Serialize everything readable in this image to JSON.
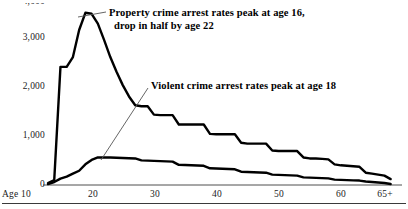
{
  "chart_data": {
    "type": "line",
    "title": "",
    "xlabel": "Age",
    "ylabel": "",
    "ylim": [
      0,
      4000
    ],
    "xlim": [
      10,
      66
    ],
    "grid": false,
    "legend_position": "none",
    "y_ticks": [
      "4,000",
      "3,000",
      "2,000",
      "1,000",
      "0"
    ],
    "y_tick_values": [
      4000,
      3000,
      2000,
      1000,
      0
    ],
    "x_ticks": [
      "Age 10",
      "20",
      "30",
      "40",
      "50",
      "60",
      "65+"
    ],
    "x_tick_values": [
      10,
      20,
      30,
      40,
      50,
      60,
      65
    ],
    "series": [
      {
        "name": "Property crime arrest rates",
        "x": [
          10,
          11,
          12,
          13,
          14,
          15,
          16,
          17,
          18,
          19,
          20,
          21,
          22,
          23,
          24,
          25,
          26,
          27,
          28,
          29,
          30,
          31,
          32,
          33,
          34,
          35,
          36,
          37,
          38,
          39,
          40,
          41,
          42,
          43,
          44,
          45,
          46,
          47,
          48,
          49,
          50,
          51,
          52,
          53,
          54,
          55,
          56,
          57,
          58,
          59,
          60,
          61,
          62,
          63,
          64,
          65
        ],
        "values": [
          40,
          100,
          2400,
          2400,
          2600,
          3150,
          3500,
          3480,
          3280,
          2950,
          2600,
          2300,
          2030,
          1800,
          1620,
          1600,
          1600,
          1430,
          1420,
          1420,
          1420,
          1230,
          1230,
          1230,
          1230,
          1230,
          1040,
          1030,
          1030,
          1030,
          1030,
          860,
          840,
          840,
          840,
          840,
          700,
          690,
          690,
          690,
          690,
          560,
          540,
          540,
          530,
          520,
          420,
          400,
          390,
          380,
          370,
          250,
          230,
          210,
          190,
          120
        ]
      },
      {
        "name": "Violent crime arrest rates",
        "x": [
          10,
          11,
          12,
          13,
          14,
          15,
          16,
          17,
          18,
          19,
          20,
          21,
          22,
          23,
          24,
          25,
          26,
          27,
          28,
          29,
          30,
          31,
          32,
          33,
          34,
          35,
          36,
          37,
          38,
          39,
          40,
          41,
          42,
          43,
          44,
          45,
          46,
          47,
          48,
          49,
          50,
          51,
          52,
          53,
          54,
          55,
          56,
          57,
          58,
          59,
          60,
          61,
          62,
          63,
          64,
          65
        ],
        "values": [
          20,
          60,
          130,
          170,
          230,
          290,
          420,
          510,
          560,
          560,
          560,
          555,
          550,
          545,
          540,
          500,
          495,
          490,
          485,
          480,
          475,
          410,
          405,
          400,
          395,
          390,
          340,
          335,
          330,
          325,
          320,
          270,
          265,
          260,
          255,
          250,
          210,
          205,
          200,
          195,
          190,
          155,
          150,
          145,
          140,
          135,
          110,
          105,
          100,
          95,
          90,
          70,
          60,
          50,
          40,
          20
        ]
      }
    ],
    "annotations": [
      {
        "id": "property-annotation",
        "line1": "Property crime arrest rates peak at age 16,",
        "line2": "drop in half by age 22",
        "points_to_series": "Property crime arrest rates"
      },
      {
        "id": "violent-annotation",
        "line1": "Violent crime arrest rates peak at age 18",
        "line2": "",
        "points_to_series": "Violent crime arrest rates"
      }
    ]
  },
  "colors": {
    "line": "#000000",
    "axis": "#3a3a3a",
    "text": "#000000",
    "background": "#ffffff",
    "leader": "#555555"
  }
}
